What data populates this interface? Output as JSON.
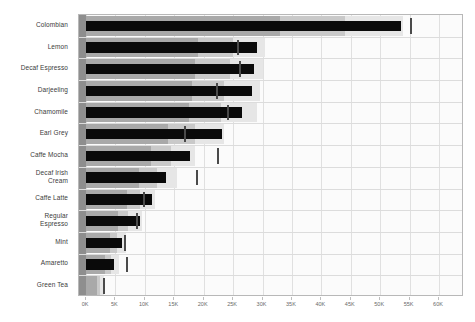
{
  "chart_data": {
    "type": "bar",
    "chart_kind": "bullet-chart",
    "title": "",
    "subtitle": "",
    "xlabel": "",
    "ylabel": "",
    "xlim": [
      0,
      60000
    ],
    "xticks": [
      0,
      5000,
      10000,
      15000,
      20000,
      25000,
      30000,
      35000,
      40000,
      45000,
      50000,
      55000,
      60000
    ],
    "xticklabels": [
      "0K",
      "5K",
      "10K",
      "15K",
      "20K",
      "25K",
      "30K",
      "35K",
      "40K",
      "45K",
      "50K",
      "55K",
      "60K"
    ],
    "grid": true,
    "legend": "none",
    "categories": [
      "Colombian",
      "Lemon",
      "Decaf Espresso",
      "Darjeeling",
      "Chamomile",
      "Earl Grey",
      "Caffe Mocha",
      "Decaf Irish Cream",
      "Caffe Latte",
      "Regular Espresso",
      "Mint",
      "Amaretto",
      "Green Tea"
    ],
    "series": [
      {
        "name": "Measure",
        "values": [
          53500,
          29000,
          28500,
          28200,
          26500,
          23200,
          17600,
          13600,
          11200,
          9100,
          6100,
          4800,
          0
        ]
      },
      {
        "name": "Target",
        "values": [
          55200,
          25900,
          26200,
          22200,
          24200,
          16900,
          22500,
          18800,
          9800,
          8700,
          6700,
          6900,
          3000
        ]
      }
    ],
    "qualitative_ranges": [
      {
        "name": "Poor",
        "color": "#a9a9a9",
        "values": [
          33000,
          19000,
          18500,
          18000,
          17500,
          14000,
          11000,
          9000,
          7000,
          5500,
          4000,
          3200,
          1800
        ]
      },
      {
        "name": "Acceptable",
        "color": "#c9c9c9",
        "values": [
          44000,
          25000,
          24500,
          23500,
          23000,
          18500,
          14500,
          12000,
          9200,
          7200,
          5200,
          4200,
          2400
        ]
      },
      {
        "name": "Good",
        "color": "#e6e6e6",
        "values": [
          53800,
          30500,
          30000,
          29500,
          29000,
          23500,
          18500,
          15500,
          11800,
          9500,
          6800,
          5600,
          3100
        ]
      }
    ]
  },
  "axis": {
    "tick_suffix": "K"
  }
}
